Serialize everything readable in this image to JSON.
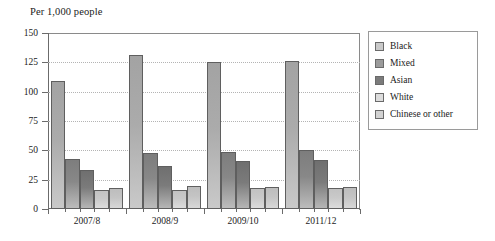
{
  "chart_data": {
    "type": "bar",
    "title": "Per 1,000 people",
    "xlabel": "",
    "ylabel": "Per 1,000 people",
    "categories": [
      "2007/8",
      "2008/9",
      "2009/10",
      "2011/12"
    ],
    "series": [
      {
        "name": "Black",
        "values": [
          109,
          131,
          125,
          126
        ]
      },
      {
        "name": "Mixed",
        "values": [
          43,
          48,
          49,
          50
        ]
      },
      {
        "name": "Asian",
        "values": [
          33,
          37,
          41,
          42
        ]
      },
      {
        "name": "White",
        "values": [
          16,
          16,
          18,
          18
        ]
      },
      {
        "name": "Chinese or other",
        "values": [
          18,
          20,
          19,
          19
        ]
      }
    ],
    "ylim": [
      0,
      150
    ],
    "yticks": [
      0,
      25,
      50,
      75,
      100,
      125,
      150
    ],
    "ytick_labels": [
      "0",
      "25",
      "50",
      "75",
      "100",
      "125",
      "150"
    ],
    "grid": true,
    "grid_axis": "y",
    "legend_position": "right",
    "series_colors": [
      "#c9c9c9",
      "#9b9b9b",
      "#7b7b7b",
      "#dcdcdc",
      "#d2d2d2"
    ]
  }
}
